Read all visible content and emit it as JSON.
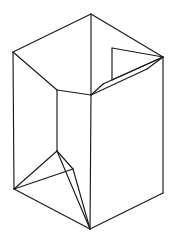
{
  "figure": {
    "type": "line-drawing",
    "canvas": {
      "width": 176,
      "height": 242,
      "background_color": "#ffffff"
    },
    "style": {
      "stroke_color": "#1a1a1a",
      "stroke_width": 1.15,
      "fill_color": "#ffffff"
    },
    "vertices": {
      "top_apex": [
        91,
        14
      ],
      "left_rear_top": [
        13,
        52
      ],
      "right_top": [
        163,
        57
      ],
      "left_bottom": [
        14,
        189
      ],
      "bottom_apex": [
        90,
        229
      ],
      "right_bottom": [
        163,
        193
      ],
      "inner_rim_center": [
        91,
        95
      ],
      "inner_left_corner": [
        57,
        90
      ],
      "inner_fold_point": [
        57,
        151
      ],
      "flap_corner_upper": [
        112,
        48
      ],
      "flap_corner_lower": [
        112,
        80
      ],
      "flap_tip": [
        103,
        84
      ],
      "flap_inner": [
        147,
        69
      ]
    },
    "segments": [
      {
        "name": "rear-left-top-edge",
        "from": [
          13,
          52
        ],
        "to": [
          91,
          14
        ]
      },
      {
        "name": "rear-right-top-edge",
        "from": [
          91,
          14
        ],
        "to": [
          163,
          57
        ]
      },
      {
        "name": "left-vertical-edge",
        "from": [
          13,
          52
        ],
        "to": [
          14,
          189
        ]
      },
      {
        "name": "right-vertical-edge",
        "from": [
          163,
          57
        ],
        "to": [
          163,
          193
        ]
      },
      {
        "name": "front-vertical-edge",
        "from": [
          91,
          95
        ],
        "to": [
          90,
          229
        ]
      },
      {
        "name": "bottom-left-edge",
        "from": [
          14,
          189
        ],
        "to": [
          90,
          229
        ]
      },
      {
        "name": "bottom-right-edge",
        "from": [
          90,
          229
        ],
        "to": [
          163,
          193
        ]
      },
      {
        "name": "inner-rim-left",
        "from": [
          13,
          52
        ],
        "to": [
          57,
          90
        ]
      },
      {
        "name": "inner-rim-front-left",
        "from": [
          57,
          90
        ],
        "to": [
          91,
          95
        ]
      },
      {
        "name": "inner-left-vertical",
        "from": [
          57,
          90
        ],
        "to": [
          57,
          151
        ]
      },
      {
        "name": "inner-fold-to-left-bottom",
        "from": [
          57,
          151
        ],
        "to": [
          14,
          189
        ]
      },
      {
        "name": "inner-fold-to-bottom-apex",
        "from": [
          57,
          151
        ],
        "to": [
          90,
          229
        ]
      },
      {
        "name": "crease-left-to-fold",
        "from": [
          14,
          189
        ],
        "to": [
          57,
          151
        ]
      },
      {
        "name": "crease-left-to-mid",
        "from": [
          14,
          189
        ],
        "to": [
          73,
          169
        ]
      },
      {
        "name": "crease-left-to-apex",
        "from": [
          14,
          189
        ],
        "to": [
          90,
          229
        ]
      },
      {
        "name": "crease-mid-to-fold",
        "from": [
          73,
          169
        ],
        "to": [
          57,
          151
        ]
      },
      {
        "name": "crease-mid-to-apex",
        "from": [
          73,
          169
        ],
        "to": [
          90,
          229
        ]
      },
      {
        "name": "flap-top-edge",
        "from": [
          112,
          48
        ],
        "to": [
          163,
          57
        ]
      },
      {
        "name": "flap-left-edge",
        "from": [
          112,
          48
        ],
        "to": [
          112,
          80
        ]
      },
      {
        "name": "flap-bottom-edge",
        "from": [
          112,
          80
        ],
        "to": [
          163,
          57
        ]
      },
      {
        "name": "flap-fold-outer",
        "from": [
          103,
          84
        ],
        "to": [
          163,
          57
        ]
      },
      {
        "name": "flap-fold-inner",
        "from": [
          91,
          95
        ],
        "to": [
          147,
          69
        ]
      },
      {
        "name": "flap-tip-edge",
        "from": [
          91,
          95
        ],
        "to": [
          103,
          84
        ]
      },
      {
        "name": "flap-right-return",
        "from": [
          147,
          69
        ],
        "to": [
          163,
          57
        ]
      },
      {
        "name": "apex-front-drop",
        "from": [
          91,
          14
        ],
        "to": [
          91,
          95
        ]
      }
    ]
  }
}
